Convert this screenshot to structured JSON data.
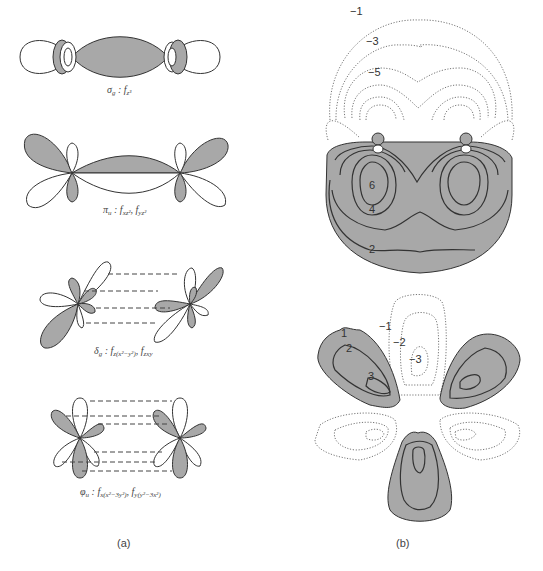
{
  "figure": {
    "panel_a": {
      "label": "(a)",
      "orbitals": [
        {
          "symmetry": "σ",
          "sym_sub": "g",
          "sep": " : ",
          "functions": [
            {
              "base": "f",
              "sub": "z³"
            }
          ]
        },
        {
          "symmetry": "π",
          "sym_sub": "u",
          "sep": " : ",
          "functions": [
            {
              "base": "f",
              "sub": "xz²"
            },
            {
              "base": "f",
              "sub": "yz²"
            }
          ]
        },
        {
          "symmetry": "δ",
          "sym_sub": "g",
          "sep": " : ",
          "functions": [
            {
              "base": "f",
              "sub": "z(x²−y²)"
            },
            {
              "base": "f",
              "sub": "zxy"
            }
          ]
        },
        {
          "symmetry": "φ",
          "sym_sub": "u",
          "sep": " : ",
          "functions": [
            {
              "base": "f",
              "sub": "x(x²−3y²)"
            },
            {
              "base": "f",
              "sub": "y(y²−3x²)"
            }
          ]
        }
      ]
    },
    "panel_b": {
      "label": "(b)",
      "top_contours": {
        "negative_labels": [
          "−1",
          "−3",
          "−5"
        ],
        "positive_labels": [
          "6",
          "4",
          "2"
        ]
      },
      "bottom_contours": {
        "positive_labels": [
          "1",
          "2",
          "3"
        ],
        "negative_labels": [
          "−1",
          "−2",
          "−3"
        ]
      }
    },
    "colors": {
      "positive_fill": "#a8a8a8",
      "outline": "#333333",
      "negative_line": "#777777"
    }
  }
}
